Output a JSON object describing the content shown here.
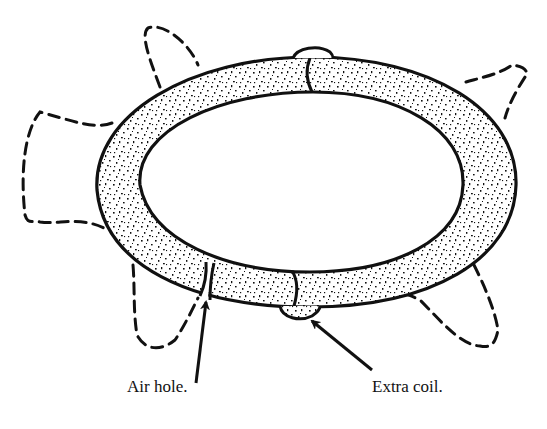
{
  "diagram": {
    "labels": [
      {
        "id": "air-hole",
        "text": "Air hole.",
        "x": 127,
        "y": 385
      },
      {
        "id": "extra-coil",
        "text": "Extra coil.",
        "x": 372,
        "y": 385
      }
    ],
    "colors": {
      "ink": "#111111",
      "background": "#ffffff"
    },
    "parts": [
      "clay-ring",
      "air-hole-gap",
      "extra-coil-patch",
      "dashed-animal-outline",
      "arrow-air-hole",
      "arrow-extra-coil"
    ]
  }
}
